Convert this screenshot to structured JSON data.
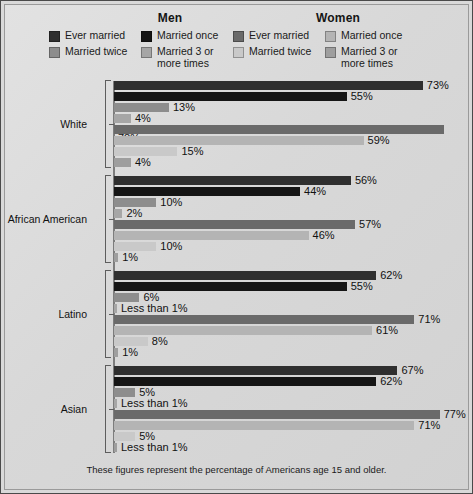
{
  "colors": {
    "frame": "#4a4a4a",
    "panel": "#dcdcdc",
    "axis": "#7d7d7d",
    "men_ever": "#2f2f2f",
    "men_once": "#151515",
    "men_twice": "#8d8d8d",
    "men_three": "#a6a6a6",
    "women_ever": "#6a6a6a",
    "women_once": "#b4b4b4",
    "women_twice": "#c9c9c9",
    "women_three": "#9e9e9e"
  },
  "header": {
    "men_title": "Men",
    "women_title": "Women",
    "men_legend": [
      {
        "label": "Ever married",
        "swatch": "men_ever"
      },
      {
        "label": "Married twice",
        "swatch": "men_twice"
      },
      {
        "label": "Married once",
        "swatch": "men_once"
      },
      {
        "label": "Married 3 or more times",
        "swatch": "men_three"
      }
    ],
    "women_legend": [
      {
        "label": "Ever married",
        "swatch": "women_ever"
      },
      {
        "label": "Married twice",
        "swatch": "women_twice"
      },
      {
        "label": "Married once",
        "swatch": "women_once"
      },
      {
        "label": "Married 3 or more times",
        "swatch": "women_three"
      }
    ]
  },
  "footnote": "These figures represent the percentage of Americans age 15 and older.",
  "chart_data": {
    "type": "bar",
    "orientation": "horizontal",
    "title": "",
    "xlabel": "",
    "ylabel": "",
    "xlim": [
      0,
      100
    ],
    "grid": false,
    "legend_position": "top",
    "categories": [
      "White",
      "African American",
      "Latino",
      "Asian"
    ],
    "series": [
      {
        "name": "Men — Ever married",
        "key": "men_ever",
        "color": "men_ever",
        "values": [
          73,
          55,
          62,
          67
        ],
        "labels": [
          "73%",
          "56%",
          "62%",
          "67%"
        ]
      },
      {
        "name": "Men — Married once",
        "key": "men_once",
        "color": "men_once",
        "values": [
          55,
          44,
          55,
          62
        ],
        "labels": [
          "55%",
          "44%",
          "55%",
          "62%"
        ]
      },
      {
        "name": "Men — Married twice",
        "key": "men_twice",
        "color": "men_twice",
        "values": [
          13,
          10,
          6,
          5
        ],
        "labels": [
          "13%",
          "10%",
          "6%",
          "5%"
        ]
      },
      {
        "name": "Men — Married 3 or more times",
        "key": "men_three",
        "color": "men_three",
        "values": [
          4,
          2,
          0.5,
          0.5
        ],
        "labels": [
          "4%",
          "2%",
          "Less than 1%",
          "Less than 1%"
        ]
      },
      {
        "name": "Women — Ever married",
        "key": "women_ever",
        "color": "women_ever",
        "values": [
          78,
          57,
          71,
          77
        ],
        "labels": [
          "78%",
          "57%",
          "71%",
          "77%"
        ]
      },
      {
        "name": "Women — Married once",
        "key": "women_once",
        "color": "women_once",
        "values": [
          59,
          46,
          61,
          71
        ],
        "labels": [
          "59%",
          "46%",
          "61%",
          "71%"
        ]
      },
      {
        "name": "Women — Married twice",
        "key": "women_twice",
        "color": "women_twice",
        "values": [
          15,
          10,
          8,
          5
        ],
        "labels": [
          "15%",
          "10%",
          "8%",
          "5%"
        ]
      },
      {
        "name": "Women — Married 3 or more times",
        "key": "women_three",
        "color": "women_three",
        "values": [
          4,
          1,
          1,
          0.5
        ],
        "labels": [
          "4%",
          "1%",
          "1%",
          "Less than 1%"
        ]
      }
    ],
    "groups": [
      {
        "category": "White",
        "bars": [
          {
            "series": "Men — Ever married",
            "color": "men_ever",
            "value": 73,
            "label": "73%"
          },
          {
            "series": "Men — Married once",
            "color": "men_once",
            "value": 55,
            "label": "55%"
          },
          {
            "series": "Men — Married twice",
            "color": "men_twice",
            "value": 13,
            "label": "13%"
          },
          {
            "series": "Men — Married 3 or more times",
            "color": "men_three",
            "value": 4,
            "label": "4%"
          },
          {
            "series": "Women — Ever married",
            "color": "women_ever",
            "value": 78,
            "label": "78%"
          },
          {
            "series": "Women — Married once",
            "color": "women_once",
            "value": 59,
            "label": "59%"
          },
          {
            "series": "Women — Married twice",
            "color": "women_twice",
            "value": 15,
            "label": "15%"
          },
          {
            "series": "Women — Married 3 or more times",
            "color": "women_three",
            "value": 4,
            "label": "4%"
          }
        ]
      },
      {
        "category": "African American",
        "bars": [
          {
            "series": "Men — Ever married",
            "color": "men_ever",
            "value": 56,
            "label": "56%"
          },
          {
            "series": "Men — Married once",
            "color": "men_once",
            "value": 44,
            "label": "44%"
          },
          {
            "series": "Men — Married twice",
            "color": "men_twice",
            "value": 10,
            "label": "10%"
          },
          {
            "series": "Men — Married 3 or more times",
            "color": "men_three",
            "value": 2,
            "label": "2%"
          },
          {
            "series": "Women — Ever married",
            "color": "women_ever",
            "value": 57,
            "label": "57%"
          },
          {
            "series": "Women — Married once",
            "color": "women_once",
            "value": 46,
            "label": "46%"
          },
          {
            "series": "Women — Married twice",
            "color": "women_twice",
            "value": 10,
            "label": "10%"
          },
          {
            "series": "Women — Married 3 or more times",
            "color": "women_three",
            "value": 1,
            "label": "1%"
          }
        ]
      },
      {
        "category": "Latino",
        "bars": [
          {
            "series": "Men — Ever married",
            "color": "men_ever",
            "value": 62,
            "label": "62%"
          },
          {
            "series": "Men — Married once",
            "color": "men_once",
            "value": 55,
            "label": "55%"
          },
          {
            "series": "Men — Married twice",
            "color": "men_twice",
            "value": 6,
            "label": "6%"
          },
          {
            "series": "Men — Married 3 or more times",
            "color": "men_three",
            "value": 0.5,
            "label": "Less than 1%"
          },
          {
            "series": "Women — Ever married",
            "color": "women_ever",
            "value": 71,
            "label": "71%"
          },
          {
            "series": "Women — Married once",
            "color": "women_once",
            "value": 61,
            "label": "61%"
          },
          {
            "series": "Women — Married twice",
            "color": "women_twice",
            "value": 8,
            "label": "8%"
          },
          {
            "series": "Women — Married 3 or more times",
            "color": "women_three",
            "value": 1,
            "label": "1%"
          }
        ]
      },
      {
        "category": "Asian",
        "bars": [
          {
            "series": "Men — Ever married",
            "color": "men_ever",
            "value": 67,
            "label": "67%"
          },
          {
            "series": "Men — Married once",
            "color": "men_once",
            "value": 62,
            "label": "62%"
          },
          {
            "series": "Men — Married twice",
            "color": "men_twice",
            "value": 5,
            "label": "5%"
          },
          {
            "series": "Men — Married 3 or more times",
            "color": "men_three",
            "value": 0.5,
            "label": "Less than 1%"
          },
          {
            "series": "Women — Ever married",
            "color": "women_ever",
            "value": 77,
            "label": "77%"
          },
          {
            "series": "Women — Married once",
            "color": "women_once",
            "value": 71,
            "label": "71%"
          },
          {
            "series": "Women — Married twice",
            "color": "women_twice",
            "value": 5,
            "label": "5%"
          },
          {
            "series": "Women — Married 3 or more times",
            "color": "women_three",
            "value": 0.5,
            "label": "Less than 1%"
          }
        ]
      }
    ]
  }
}
